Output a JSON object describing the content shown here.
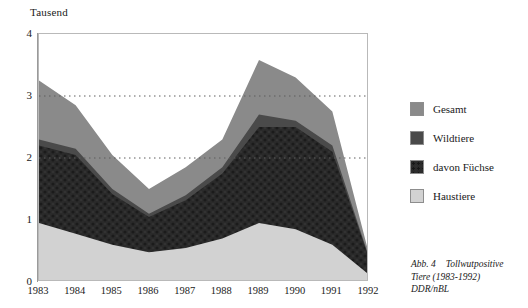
{
  "axis_title": "Tausend",
  "legend": {
    "items": [
      {
        "label": "Gesamt",
        "color": "#8a8a8a"
      },
      {
        "label": "Wildtiere",
        "color": "#4a4a4a"
      },
      {
        "label": "davon Füchse",
        "color": "#2a2a2a"
      },
      {
        "label": "Haustiere",
        "color": "#d2d2d2"
      }
    ]
  },
  "caption": {
    "line1_label": "Abb. 4",
    "line1_text": "Tollwutpositive",
    "line2": "Tiere (1983-1992)",
    "line3": "DDR/nBL"
  },
  "chart_data": {
    "type": "area",
    "title": "Tollwutpositive Tiere (1983-1992) DDR/nBL",
    "xlabel": "",
    "ylabel": "Tausend",
    "ylim": [
      0,
      4
    ],
    "yticks": [
      0,
      1,
      2,
      3,
      4
    ],
    "grid": "dotted horizontal gridlines at 2 and 3",
    "gridlines": [
      2,
      3
    ],
    "legend_position": "right",
    "stacked": false,
    "note": "Overlaid cumulative curves: Gesamt is the total envelope, Wildtiere lies below it, davon Fuechse is a subset of Wildtiere, Haustiere is the lowest band.",
    "categories": [
      "1983",
      "1984",
      "1985",
      "1986",
      "1987",
      "1988",
      "1989",
      "1990",
      "1991",
      "1992"
    ],
    "x": [
      1983,
      1984,
      1985,
      1986,
      1987,
      1988,
      1989,
      1990,
      1991,
      1992
    ],
    "series": [
      {
        "name": "Gesamt",
        "color": "#8a8a8a",
        "values": [
          3.25,
          2.85,
          2.05,
          1.5,
          1.85,
          2.3,
          3.58,
          3.3,
          2.75,
          0.45
        ]
      },
      {
        "name": "Wildtiere",
        "color": "#4a4a4a",
        "values": [
          2.3,
          2.15,
          1.5,
          1.1,
          1.4,
          1.85,
          2.7,
          2.6,
          2.2,
          0.4
        ]
      },
      {
        "name": "davon Füchse",
        "color": "#2a2a2a",
        "values": [
          2.2,
          2.05,
          1.42,
          1.05,
          1.32,
          1.75,
          2.5,
          2.5,
          2.1,
          0.38
        ]
      },
      {
        "name": "Haustiere",
        "color": "#d2d2d2",
        "values": [
          0.95,
          0.78,
          0.6,
          0.48,
          0.55,
          0.7,
          0.95,
          0.85,
          0.6,
          0.12
        ]
      }
    ]
  }
}
